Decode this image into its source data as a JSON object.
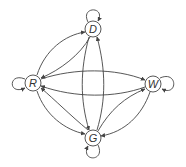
{
  "diagram": {
    "type": "state-transition-graph",
    "nodes": [
      {
        "id": "D",
        "label": "D",
        "self_loop": true
      },
      {
        "id": "R",
        "label": "R",
        "self_loop": true
      },
      {
        "id": "W",
        "label": "W",
        "self_loop": true
      },
      {
        "id": "G",
        "label": "G",
        "self_loop": true
      }
    ],
    "edges": [
      {
        "from": "R",
        "to": "D"
      },
      {
        "from": "D",
        "to": "R"
      },
      {
        "from": "R",
        "to": "W"
      },
      {
        "from": "W",
        "to": "R"
      },
      {
        "from": "R",
        "to": "G"
      },
      {
        "from": "G",
        "to": "R"
      },
      {
        "from": "D",
        "to": "G"
      },
      {
        "from": "G",
        "to": "D"
      },
      {
        "from": "W",
        "to": "G"
      },
      {
        "from": "G",
        "to": "W"
      }
    ],
    "colors": {
      "stroke": "#444444",
      "background": "#ffffff"
    }
  }
}
